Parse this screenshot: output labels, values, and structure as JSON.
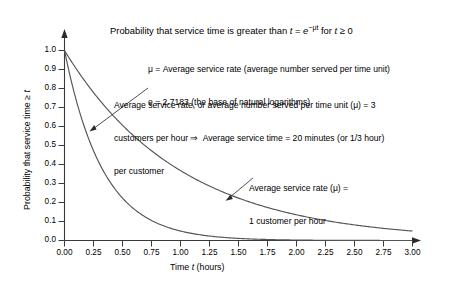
{
  "chart_data": {
    "type": "line",
    "title": "Probability that service time is greater than t = e−μt for t ≥ 0",
    "xlabel": "Time t (hours)",
    "ylabel": "Probability that service time ≥ t",
    "xlim": [
      0,
      3
    ],
    "ylim": [
      0,
      1
    ],
    "grid": false,
    "legend_position": "inline-annotations",
    "x_ticks": [
      "0.00",
      "0.25",
      "0.50",
      "0.75",
      "1.00",
      "1.25",
      "1.50",
      "1.75",
      "2.00",
      "2.25",
      "2.50",
      "2.75",
      "3.00"
    ],
    "x_tick_values": [
      0,
      0.25,
      0.5,
      0.75,
      1.0,
      1.25,
      1.5,
      1.75,
      2.0,
      2.25,
      2.5,
      2.75,
      3.0
    ],
    "y_ticks": [
      "0.0",
      "0.1",
      "0.2",
      "0.3",
      "0.4",
      "0.5",
      "0.6",
      "0.7",
      "0.8",
      "0.9",
      "1.0"
    ],
    "y_tick_values": [
      0,
      0.1,
      0.2,
      0.3,
      0.4,
      0.5,
      0.6,
      0.7,
      0.8,
      0.9,
      1.0
    ],
    "x": [
      0,
      0.125,
      0.25,
      0.375,
      0.5,
      0.625,
      0.75,
      0.875,
      1.0,
      1.125,
      1.25,
      1.375,
      1.5,
      1.625,
      1.75,
      1.875,
      2.0,
      2.125,
      2.25,
      2.375,
      2.5,
      2.625,
      2.75,
      2.875,
      3.0
    ],
    "series": [
      {
        "name": "mu = 3 customers per hour",
        "mu": 3,
        "values": [
          1.0,
          0.687,
          0.472,
          0.325,
          0.223,
          0.153,
          0.105,
          0.072,
          0.05,
          0.034,
          0.024,
          0.016,
          0.011,
          0.008,
          0.005,
          0.004,
          0.002,
          0.002,
          0.001,
          0.001,
          0.001,
          0.0,
          0.0,
          0.0,
          0.0
        ],
        "color": "#555555"
      },
      {
        "name": "mu = 1 customer per hour",
        "mu": 1,
        "values": [
          1.0,
          0.882,
          0.779,
          0.687,
          0.607,
          0.535,
          0.472,
          0.417,
          0.368,
          0.325,
          0.287,
          0.253,
          0.223,
          0.197,
          0.174,
          0.153,
          0.135,
          0.119,
          0.105,
          0.093,
          0.082,
          0.072,
          0.064,
          0.056,
          0.05
        ],
        "color": "#555555"
      }
    ],
    "annotations": [
      {
        "id": "mu3",
        "lines": [
          "Average service rate, or average number served per time unit (μ) = 3",
          "customers per hour ⇒  Average service time = 20 minutes (or 1/3 hour)",
          "per customer"
        ],
        "points_to": [
          0.25,
          0.47
        ]
      },
      {
        "id": "mu1",
        "lines": [
          "Average service rate (μ) =",
          "1 customer per hour"
        ],
        "points_to": [
          1.42,
          0.21
        ]
      }
    ],
    "notes": [
      "μ = Average service rate (average number served per time unit)",
      "e = 2.7183 (the base of natural logarithms)"
    ]
  },
  "chart": {
    "title_prefix": "Probability that service time is greater than ",
    "title_var_t": "t",
    "title_eq": " = ",
    "title_e": "e",
    "title_exp": "−μt",
    "title_suffix": " for ",
    "title_var_t2": "t",
    "title_ge": " ≥ 0",
    "note_1": "μ = Average service rate (average number served per time unit)",
    "note_2": "e = 2.7183 (the base of natural logarithms)",
    "ann_mu3_line1": "Average service rate, or average number served per time unit (μ) = 3",
    "ann_mu3_line2": "customers per hour ⇒  Average service time = 20 minutes (or 1/3 hour)",
    "ann_mu3_line3": "per customer",
    "ann_mu1_line1": "Average service rate (μ) =",
    "ann_mu1_line2": "1 customer per hour",
    "x_axis_title_pre": "Time ",
    "x_axis_title_var": "t",
    "x_axis_title_post": " (hours)",
    "y_axis_title_pre": "Probability that service time ≥ ",
    "y_axis_title_var": "t"
  }
}
